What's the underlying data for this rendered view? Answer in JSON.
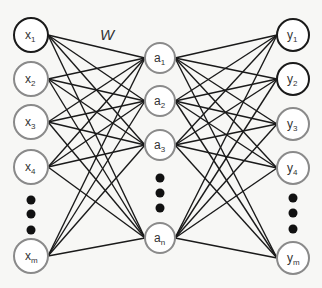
{
  "diagram": {
    "type": "neural-network",
    "weight_label": "W",
    "weight_label_pos": {
      "x": 100,
      "y": 40
    },
    "colors": {
      "background": "#f7f7f5",
      "edge": "#1a1a1a",
      "node_stroke_dark": "#1a1a1a",
      "node_stroke": "#8a8a8a",
      "node_fill": "#ffffff",
      "ellipsis_dot": "#111111",
      "text": "#333333"
    },
    "layers": [
      {
        "name": "input",
        "x": 31,
        "r": 17,
        "nodes": [
          {
            "label": "x",
            "sub": "1",
            "y": 35,
            "dark": true
          },
          {
            "label": "x",
            "sub": "2",
            "y": 79,
            "dark": false
          },
          {
            "label": "x",
            "sub": "3",
            "y": 122,
            "dark": false
          },
          {
            "label": "x",
            "sub": "4",
            "y": 167,
            "dark": false
          },
          {
            "label": "x",
            "sub": "m",
            "y": 256,
            "dark": false
          }
        ],
        "ellipsis_y": [
          200,
          214,
          230
        ]
      },
      {
        "name": "hidden",
        "x": 160,
        "r": 15,
        "nodes": [
          {
            "label": "a",
            "sub": "1",
            "y": 58,
            "dark": false
          },
          {
            "label": "a",
            "sub": "2",
            "y": 101,
            "dark": false
          },
          {
            "label": "a",
            "sub": "3",
            "y": 145,
            "dark": false
          },
          {
            "label": "a",
            "sub": "n",
            "y": 238,
            "dark": false
          }
        ],
        "ellipsis_y": [
          178,
          193,
          208
        ]
      },
      {
        "name": "output",
        "x": 293,
        "r": 16,
        "nodes": [
          {
            "label": "y",
            "sub": "1",
            "y": 35,
            "dark": true
          },
          {
            "label": "y",
            "sub": "2",
            "y": 79,
            "dark": true
          },
          {
            "label": "y",
            "sub": "3",
            "y": 124,
            "dark": false
          },
          {
            "label": "y",
            "sub": "4",
            "y": 168,
            "dark": false
          },
          {
            "label": "y",
            "sub": "m",
            "y": 258,
            "dark": false
          }
        ],
        "ellipsis_y": [
          198,
          213,
          229
        ]
      }
    ],
    "connections": "fully-connected between adjacent layers"
  }
}
